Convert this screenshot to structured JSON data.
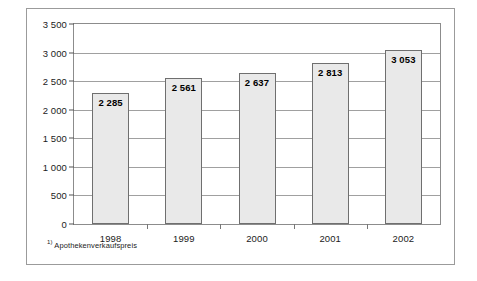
{
  "chart_data": {
    "type": "bar",
    "title": "",
    "subtitle": "",
    "xlabel": "",
    "ylabel": "",
    "categories": [
      "1998",
      "1999",
      "2000",
      "2001",
      "2002"
    ],
    "values": [
      2285,
      2561,
      2637,
      2813,
      3053
    ],
    "value_labels": [
      "2 285",
      "2 561",
      "2 637",
      "2 813",
      "3 053"
    ],
    "ylim": [
      0,
      3500
    ],
    "ytick_values": [
      0,
      500,
      1000,
      1500,
      2000,
      2500,
      3000,
      3500
    ],
    "ytick_labels": [
      "0",
      "500",
      "1 000",
      "1 500",
      "2 000",
      "2 500",
      "3 000",
      "3 500"
    ],
    "grid": true,
    "legend": null,
    "footnote_marker": "1)",
    "footnote_text": "Apothekenverkaufspreis",
    "bar_fill_color": "#e9e9e9",
    "bar_border_color": "#6f6f6f",
    "gridline_color": "#a0a0a0",
    "frame_color": "#9b9b9b",
    "background_color": "#ffffff"
  }
}
